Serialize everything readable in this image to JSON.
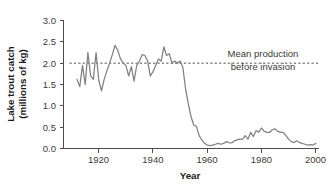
{
  "chart_data": {
    "type": "line",
    "title": "",
    "xlabel": "Year",
    "ylabel": "Lake trout catch\n(millions of kg)",
    "ylabel_line1": "Lake trout catch",
    "ylabel_line2": "(millions of kg)",
    "xlim": [
      1907,
      2001
    ],
    "ylim": [
      0.0,
      3.0
    ],
    "grid": false,
    "legend": "none",
    "x_ticks": [
      1920,
      1940,
      1960,
      1980,
      2000
    ],
    "x_tick_labels": [
      "1920",
      "1940",
      "1960",
      "1980",
      "2000"
    ],
    "y_ticks": [
      0.0,
      0.5,
      1.0,
      1.5,
      2.0,
      2.5,
      3.0
    ],
    "y_tick_labels": [
      "0.0",
      "0.5",
      "1.0",
      "1.5",
      "2.0",
      "2.5",
      "3.0"
    ],
    "line_color": "#808080",
    "annotations": [
      {
        "name": "mean-production-reference",
        "type": "horizontal-line",
        "value": 2.0,
        "style": "dashed",
        "color": "#4d4d4d",
        "label_line1": "Mean production",
        "label_line2": "before invasion"
      }
    ],
    "series": [
      {
        "name": "Lake trout catch",
        "x": [
          1912,
          1913,
          1914,
          1915,
          1916,
          1917,
          1918,
          1919,
          1920,
          1921,
          1922,
          1923,
          1924,
          1925,
          1926,
          1927,
          1928,
          1929,
          1930,
          1931,
          1932,
          1933,
          1934,
          1935,
          1936,
          1937,
          1938,
          1939,
          1940,
          1941,
          1942,
          1943,
          1944,
          1945,
          1946,
          1947,
          1948,
          1949,
          1950,
          1951,
          1952,
          1953,
          1954,
          1955,
          1956,
          1957,
          1958,
          1959,
          1960,
          1961,
          1962,
          1963,
          1964,
          1965,
          1966,
          1967,
          1968,
          1969,
          1970,
          1971,
          1972,
          1973,
          1974,
          1975,
          1976,
          1977,
          1978,
          1979,
          1980,
          1981,
          1982,
          1983,
          1984,
          1985,
          1986,
          1987,
          1988,
          1989,
          1990,
          1991,
          1992,
          1993,
          1994,
          1995,
          1996,
          1997,
          1998,
          1999,
          2000
        ],
        "values": [
          1.62,
          1.45,
          1.95,
          1.5,
          2.25,
          1.7,
          1.62,
          2.25,
          1.6,
          1.35,
          1.62,
          1.82,
          2.0,
          2.2,
          2.42,
          2.3,
          2.1,
          2.0,
          1.95,
          1.7,
          1.92,
          1.58,
          1.95,
          2.05,
          2.2,
          2.18,
          2.05,
          1.7,
          1.8,
          1.95,
          2.1,
          2.05,
          2.38,
          2.18,
          2.22,
          2.0,
          2.05,
          2.0,
          2.05,
          1.9,
          1.4,
          1.05,
          0.75,
          0.55,
          0.52,
          0.3,
          0.2,
          0.12,
          0.08,
          0.07,
          0.08,
          0.1,
          0.12,
          0.1,
          0.12,
          0.16,
          0.14,
          0.13,
          0.18,
          0.2,
          0.22,
          0.22,
          0.3,
          0.22,
          0.38,
          0.28,
          0.42,
          0.38,
          0.48,
          0.4,
          0.38,
          0.38,
          0.44,
          0.46,
          0.4,
          0.38,
          0.38,
          0.3,
          0.22,
          0.16,
          0.14,
          0.18,
          0.14,
          0.12,
          0.1,
          0.08,
          0.09,
          0.08,
          0.12
        ]
      }
    ]
  },
  "annotation_text": {
    "line1": "Mean production",
    "line2": "before invasion"
  },
  "axis": {
    "x_title": "Year",
    "y_title_line1": "Lake trout catch",
    "y_title_line2": "(millions of kg)"
  }
}
